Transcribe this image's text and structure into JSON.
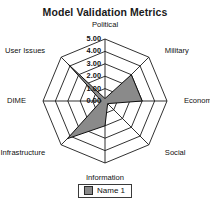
{
  "chart_data": {
    "type": "radar",
    "title": "Model Validation Metrics",
    "categories": [
      "Political",
      "Military",
      "Economic",
      "Social",
      "Information",
      "Infrastructure",
      "DIME",
      "User Issues"
    ],
    "series": [
      {
        "name": "Name 1",
        "values": [
          0.2,
          3.0,
          3.0,
          0.3,
          2.0,
          4.3,
          0.3,
          4.2
        ],
        "color": "#8a8a8a"
      }
    ],
    "tick_labels": [
      "0.00",
      "1.00",
      "2.00",
      "3.00",
      "4.00",
      "5.00"
    ],
    "tick_values": [
      0,
      1,
      2,
      3,
      4,
      5
    ],
    "rlim": [
      0,
      5
    ],
    "grid": true,
    "grid_shape": "polygon",
    "legend_position": "bottom",
    "xlabel": "",
    "ylabel": ""
  },
  "legend": {
    "entries": [
      {
        "label": "Name 1"
      }
    ]
  },
  "colors": {
    "series_fill": "#8a8a8a",
    "series_stroke": "#111111",
    "grid": "#1a1a1a",
    "background": "#ffffff"
  }
}
